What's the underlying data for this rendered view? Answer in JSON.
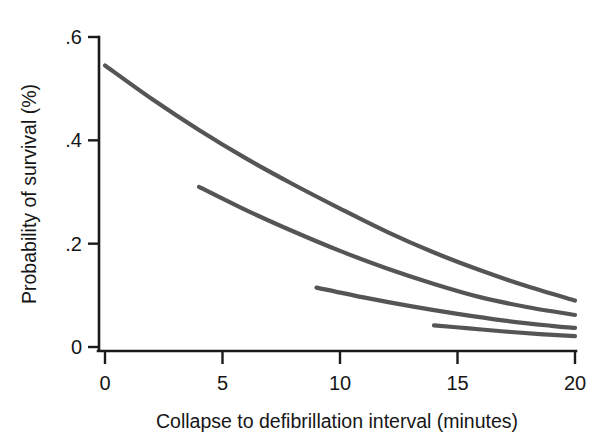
{
  "figure": {
    "background_color": "#ffffff",
    "axis_color": "#1a1a1a",
    "curve_color": "#555555",
    "width": 604,
    "height": 446
  },
  "chart_data": {
    "type": "line",
    "title": "",
    "xlabel": "Collapse to defibrillation interval (minutes)",
    "ylabel": "Probability of survival (%)",
    "xlim": [
      0,
      20
    ],
    "ylim": [
      0,
      0.6
    ],
    "xticks": [
      0,
      5,
      10,
      15,
      20
    ],
    "xticklabels": [
      "0",
      "5",
      "10",
      "15",
      "20"
    ],
    "yticks": [
      0,
      0.2,
      0.4,
      0.6
    ],
    "yticklabels": [
      "0",
      ".2",
      ".4",
      ".6"
    ],
    "grid": false,
    "legend": false,
    "legend_position": "none",
    "series": [
      {
        "name": "curve-1",
        "color": "#555555",
        "x": [
          0,
          2,
          4,
          6,
          8,
          10,
          12,
          14,
          16,
          18,
          20
        ],
        "values": [
          0.545,
          0.48,
          0.42,
          0.365,
          0.315,
          0.268,
          0.223,
          0.183,
          0.148,
          0.117,
          0.09
        ]
      },
      {
        "name": "curve-2",
        "color": "#555555",
        "x": [
          4,
          6,
          8,
          10,
          12,
          14,
          16,
          18,
          20
        ],
        "values": [
          0.31,
          0.265,
          0.224,
          0.186,
          0.152,
          0.122,
          0.096,
          0.077,
          0.062
        ]
      },
      {
        "name": "curve-3",
        "color": "#555555",
        "x": [
          9,
          11,
          13,
          15,
          17,
          19,
          20
        ],
        "values": [
          0.115,
          0.096,
          0.079,
          0.064,
          0.051,
          0.041,
          0.037
        ]
      },
      {
        "name": "curve-4",
        "color": "#555555",
        "x": [
          14,
          15.5,
          17,
          18.5,
          20
        ],
        "values": [
          0.042,
          0.036,
          0.03,
          0.025,
          0.021
        ]
      }
    ]
  }
}
